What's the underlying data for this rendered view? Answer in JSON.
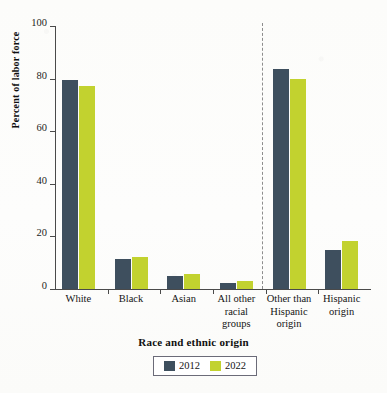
{
  "chart_data": {
    "type": "bar",
    "title": "",
    "xlabel": "Race and ethnic origin",
    "ylabel": "Percent of labor force",
    "categories": [
      "White",
      "Black",
      "Asian",
      "All other racial groups",
      "Other than Hispanic origin",
      "Hispanic origin"
    ],
    "category_lines": [
      [
        "White"
      ],
      [
        "Black"
      ],
      [
        "Asian"
      ],
      [
        "All other",
        "racial",
        "groups"
      ],
      [
        "Other than",
        "Hispanic",
        "origin"
      ],
      [
        "Hispanic",
        "origin"
      ]
    ],
    "series": [
      {
        "name": "2012",
        "color": "#3e4f5e",
        "values": [
          79.5,
          11.5,
          4.9,
          2.4,
          83.5,
          14.7
        ]
      },
      {
        "name": "2022",
        "color": "#c2d22f",
        "values": [
          77.2,
          12.1,
          5.7,
          3.1,
          80.0,
          18.2
        ]
      }
    ],
    "ylim": [
      0,
      100
    ],
    "yticks": [
      0,
      20,
      40,
      60,
      80,
      100
    ],
    "ytick_labels": [
      "0",
      "20",
      "40",
      "60",
      "80",
      "100"
    ],
    "grid": false,
    "legend_position": "bottom-center",
    "annotations": [
      {
        "name": "group-divider",
        "type": "vertical-dashed-line",
        "between_categories": [
          "All other racial groups",
          "Other than Hispanic origin"
        ],
        "color": "#8d8d8d"
      }
    ]
  },
  "legend": {
    "entries": [
      {
        "label": "2012",
        "color": "#3e4f5e"
      },
      {
        "label": "2022",
        "color": "#c2d22f"
      }
    ]
  },
  "axes": {
    "y_title": "Percent of labor force",
    "x_title": "Race and ethnic origin",
    "y_tick_labels": [
      "0",
      "20",
      "40",
      "60",
      "80",
      "100"
    ]
  },
  "colors": {
    "series_2012": "#3e4f5e",
    "series_2022": "#c2d22f",
    "axis": "#4a4a4a",
    "divider": "#8d8d8d",
    "background": "#fdfdfb"
  }
}
